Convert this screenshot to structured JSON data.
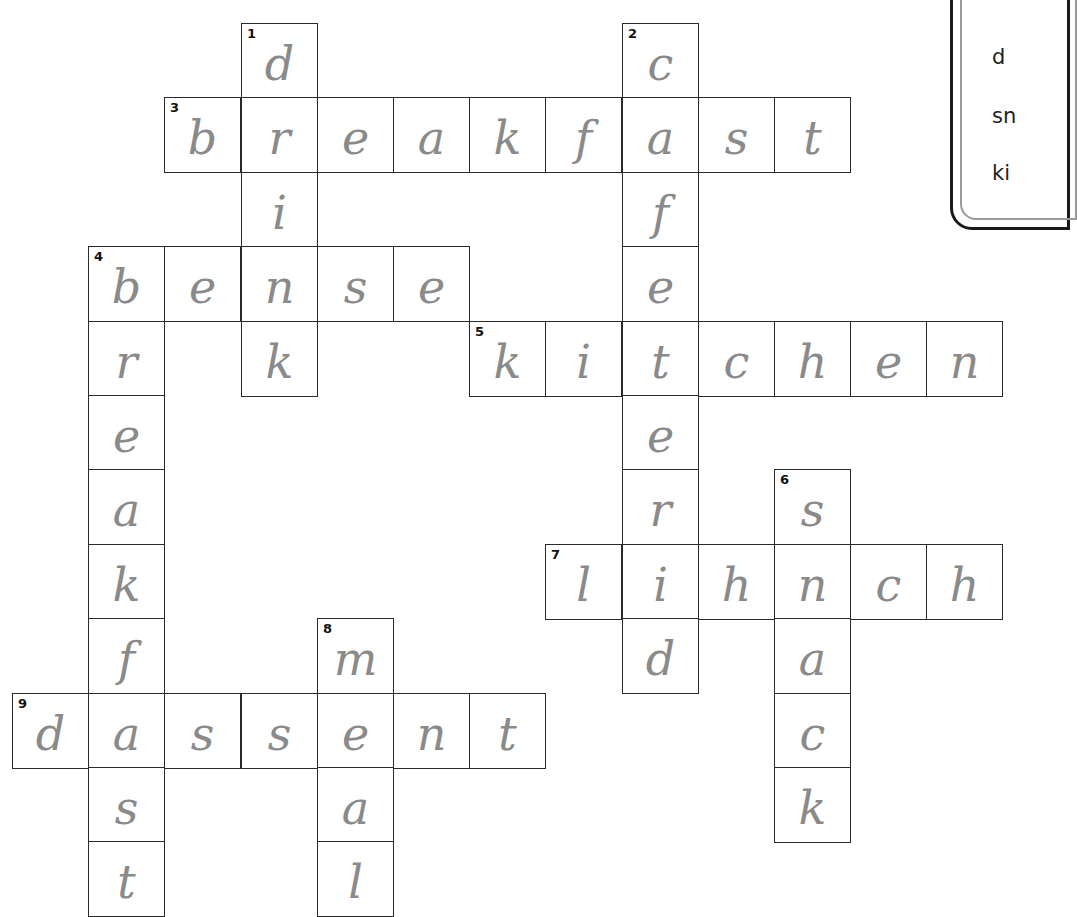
{
  "puzzle": {
    "cell_size": 76,
    "origin_x": 12,
    "origin_y": 23,
    "col_step": 76.2,
    "row_step": 74.4,
    "entries": [
      {
        "number": "1",
        "direction": "down",
        "col": 3,
        "row": 0,
        "letters": [
          "d",
          "r",
          "i",
          "n",
          "k"
        ]
      },
      {
        "number": "2",
        "direction": "down",
        "col": 8,
        "row": 0,
        "letters": [
          "c",
          "a",
          "f",
          "e",
          "t",
          "e",
          "r",
          "i",
          "d"
        ]
      },
      {
        "number": "3",
        "direction": "across",
        "col": 2,
        "row": 1,
        "letters": [
          "b",
          "r",
          "e",
          "a",
          "k",
          "f",
          "a",
          "s",
          "t"
        ]
      },
      {
        "number": "4",
        "direction": "across",
        "col": 1,
        "row": 3,
        "letters": [
          "b",
          "e",
          "n",
          "s",
          "e"
        ]
      },
      {
        "number": "4",
        "direction": "down",
        "col": 1,
        "row": 3,
        "letters": [
          "b",
          "r",
          "e",
          "a",
          "k",
          "f",
          "a",
          "s",
          "t"
        ]
      },
      {
        "number": "5",
        "direction": "across",
        "col": 6,
        "row": 4,
        "letters": [
          "k",
          "i",
          "t",
          "c",
          "h",
          "e",
          "n"
        ]
      },
      {
        "number": "6",
        "direction": "down",
        "col": 10,
        "row": 6,
        "letters": [
          "s",
          "n",
          "a",
          "c",
          "k"
        ]
      },
      {
        "number": "7",
        "direction": "across",
        "col": 7,
        "row": 7,
        "letters": [
          "l",
          "i",
          "h",
          "n",
          "c",
          "h"
        ]
      },
      {
        "number": "8",
        "direction": "down",
        "col": 4,
        "row": 8,
        "letters": [
          "m",
          "e",
          "a",
          "l"
        ]
      },
      {
        "number": "9",
        "direction": "across",
        "col": 0,
        "row": 9,
        "letters": [
          "d",
          "a",
          "s",
          "s",
          "e",
          "n",
          "t"
        ]
      }
    ]
  },
  "word_bank": {
    "words": [
      "d",
      "sn",
      "ki"
    ]
  },
  "colors": {
    "grid_line": "#2a2a2a",
    "pencil": "#8a8a8a",
    "background": "#ffffff"
  }
}
